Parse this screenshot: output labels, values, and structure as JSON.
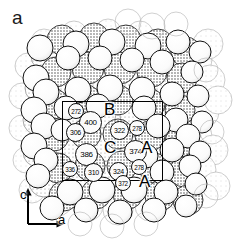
{
  "figure": {
    "panel_label": "a",
    "caption_type": "crystal-structure-space-filling-projection"
  },
  "axes": {
    "vertical_label": "c",
    "horizontal_label": "a"
  },
  "site_letters": [
    {
      "id": "B",
      "label": "B",
      "x": 104,
      "y": 101
    },
    {
      "id": "C",
      "label": "C",
      "x": 104,
      "y": 139
    },
    {
      "id": "A1",
      "label": "A",
      "x": 141,
      "y": 139
    },
    {
      "id": "A2",
      "label": "A",
      "x": 139,
      "y": 173
    }
  ],
  "atom_labels": [
    {
      "id": "272",
      "value": "272",
      "x": 68,
      "y": 103,
      "size": "sml"
    },
    {
      "id": "400",
      "value": "400",
      "x": 79,
      "y": 111,
      "size": "big"
    },
    {
      "id": "306",
      "value": "306",
      "x": 66,
      "y": 123,
      "size": "med"
    },
    {
      "id": "322",
      "value": "322",
      "x": 110,
      "y": 121,
      "size": "med"
    },
    {
      "id": "278a",
      "value": "278",
      "x": 129,
      "y": 120,
      "size": "sml"
    },
    {
      "id": "386",
      "value": "386",
      "x": 75,
      "y": 143,
      "size": "big"
    },
    {
      "id": "374",
      "value": "374",
      "x": 124,
      "y": 140,
      "size": "big"
    },
    {
      "id": "336",
      "value": "336",
      "x": 62,
      "y": 161,
      "size": "sml"
    },
    {
      "id": "310",
      "value": "310",
      "x": 84,
      "y": 163,
      "size": "med"
    },
    {
      "id": "324",
      "value": "324",
      "x": 109,
      "y": 162,
      "size": "med"
    },
    {
      "id": "278b",
      "value": "278",
      "x": 131,
      "y": 159,
      "size": "sml"
    },
    {
      "id": "372",
      "value": "372",
      "x": 115,
      "y": 175,
      "size": "sml"
    }
  ],
  "unit_cell": {
    "left": 62,
    "top": 101,
    "width": 101,
    "height": 80
  },
  "colors": {
    "background": "#ffffff",
    "outline": "#000000",
    "sphere_light": "#ffffff",
    "sphere_stipple": "#b9b9b9",
    "sphere_faint": "#dcdcdc",
    "label_fill": "#fbfbfb"
  }
}
